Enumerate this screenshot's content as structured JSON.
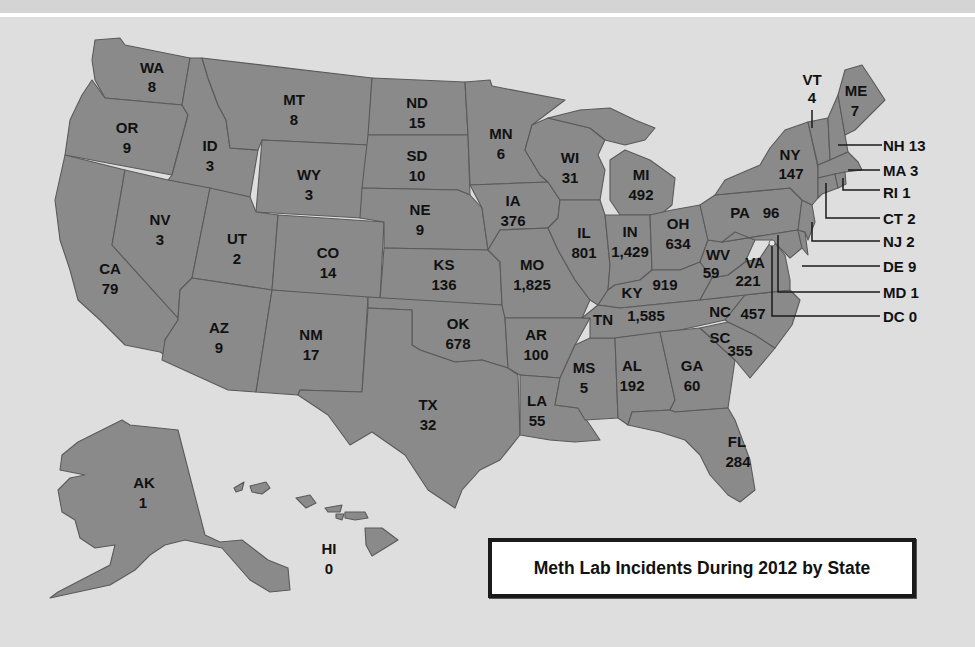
{
  "title": "Meth Lab Incidents During 2012 by State",
  "colors": {
    "background": "#dedede",
    "state_fill": "#8a8a8a",
    "state_border": "#5a5a5a",
    "text": "#111111",
    "title_box_fill": "#ffffff",
    "title_box_border": "#1a1a1a"
  },
  "states": {
    "WA": {
      "abbr": "WA",
      "value": "8"
    },
    "OR": {
      "abbr": "OR",
      "value": "9"
    },
    "CA": {
      "abbr": "CA",
      "value": "79"
    },
    "ID": {
      "abbr": "ID",
      "value": "3"
    },
    "NV": {
      "abbr": "NV",
      "value": "3"
    },
    "MT": {
      "abbr": "MT",
      "value": "8"
    },
    "WY": {
      "abbr": "WY",
      "value": "3"
    },
    "UT": {
      "abbr": "UT",
      "value": "2"
    },
    "AZ": {
      "abbr": "AZ",
      "value": "9"
    },
    "CO": {
      "abbr": "CO",
      "value": "14"
    },
    "NM": {
      "abbr": "NM",
      "value": "17"
    },
    "ND": {
      "abbr": "ND",
      "value": "15"
    },
    "SD": {
      "abbr": "SD",
      "value": "10"
    },
    "NE": {
      "abbr": "NE",
      "value": "9"
    },
    "KS": {
      "abbr": "KS",
      "value": "136"
    },
    "OK": {
      "abbr": "OK",
      "value": "678"
    },
    "TX": {
      "abbr": "TX",
      "value": "32"
    },
    "MN": {
      "abbr": "MN",
      "value": "6"
    },
    "IA": {
      "abbr": "IA",
      "value": "376"
    },
    "MO": {
      "abbr": "MO",
      "value": "1,825"
    },
    "AR": {
      "abbr": "AR",
      "value": "100"
    },
    "LA": {
      "abbr": "LA",
      "value": "55"
    },
    "WI": {
      "abbr": "WI",
      "value": "31"
    },
    "IL": {
      "abbr": "IL",
      "value": "801"
    },
    "MS": {
      "abbr": "MS",
      "value": "5"
    },
    "MI": {
      "abbr": "MI",
      "value": "492"
    },
    "IN": {
      "abbr": "IN",
      "value": "1,429"
    },
    "OH": {
      "abbr": "OH",
      "value": "634"
    },
    "KY": {
      "abbr": "KY",
      "value": "919"
    },
    "TN": {
      "abbr": "TN",
      "value": "1,585"
    },
    "AL": {
      "abbr": "AL",
      "value": "192"
    },
    "GA": {
      "abbr": "GA",
      "value": "60"
    },
    "FL": {
      "abbr": "FL",
      "value": "284"
    },
    "SC": {
      "abbr": "SC",
      "value": "355"
    },
    "NC": {
      "abbr": "NC",
      "value": "457"
    },
    "VA": {
      "abbr": "VA",
      "value": "221"
    },
    "WV": {
      "abbr": "WV",
      "value": "59"
    },
    "PA": {
      "abbr": "PA",
      "value": "96"
    },
    "NY": {
      "abbr": "NY",
      "value": "147"
    },
    "VT": {
      "abbr": "VT",
      "value": "4"
    },
    "ME": {
      "abbr": "ME",
      "value": "7"
    },
    "AK": {
      "abbr": "AK",
      "value": "1"
    },
    "HI": {
      "abbr": "HI",
      "value": "0"
    }
  },
  "callouts": [
    {
      "label": "NH 13"
    },
    {
      "label": "MA 3"
    },
    {
      "label": "RI 1"
    },
    {
      "label": "CT 2"
    },
    {
      "label": "NJ 2"
    },
    {
      "label": "DE 9"
    },
    {
      "label": "MD 1"
    },
    {
      "label": "DC 0"
    }
  ]
}
